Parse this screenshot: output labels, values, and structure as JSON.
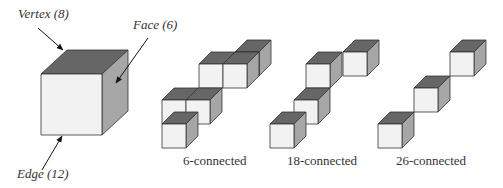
{
  "labels": {
    "vertex": "Vertex (8)",
    "face": "Face (6)",
    "edge": "Edge (12)",
    "six": "6-connected",
    "eighteen": "18-connected",
    "twentysix": "26-connected"
  },
  "colors": {
    "front": "#f2f2f2",
    "top": "#666666",
    "side": "#a6a6a6",
    "stroke": "#333333"
  },
  "main_cube": {
    "x": 41,
    "y": 74,
    "s": 61,
    "dx": 26,
    "dy": -24
  },
  "groups": [
    {
      "name": "6-connected",
      "s": 24,
      "dx": 12,
      "dy": -12,
      "cubes": [
        [
          235,
          52
        ],
        [
          199,
          64
        ],
        [
          223,
          64
        ],
        [
          162,
          100
        ],
        [
          186,
          100
        ],
        [
          162,
          124
        ]
      ]
    },
    {
      "name": "18-connected",
      "s": 24,
      "dx": 12,
      "dy": -12,
      "cubes": [
        [
          343,
          52
        ],
        [
          306,
          64
        ],
        [
          294,
          100
        ],
        [
          270,
          124
        ]
      ]
    },
    {
      "name": "26-connected",
      "s": 24,
      "dx": 12,
      "dy": -12,
      "cubes": [
        [
          450,
          52
        ],
        [
          414,
          88
        ],
        [
          378,
          124
        ]
      ]
    }
  ]
}
